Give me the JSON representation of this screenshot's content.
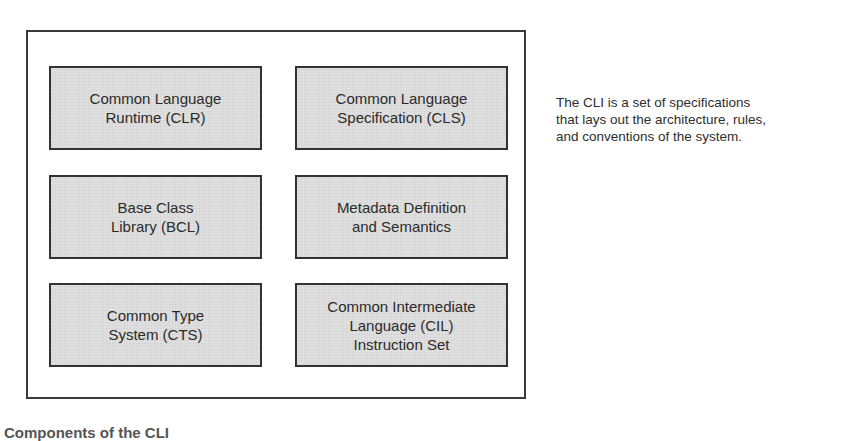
{
  "diagram": {
    "title": "Components of the CLI",
    "boxes": [
      {
        "label": "Common Language\nRuntime (CLR)"
      },
      {
        "label": "Common Language\nSpecification (CLS)"
      },
      {
        "label": "Base Class\nLibrary (BCL)"
      },
      {
        "label": "Metadata Definition\nand Semantics"
      },
      {
        "label": "Common Type\nSystem (CTS)"
      },
      {
        "label": "Common Intermediate\nLanguage (CIL)\nInstruction Set"
      }
    ],
    "annotation": "The CLI is a set of specifications\nthat lays out the architecture, rules,\nand conventions of the system.",
    "caption": "Components of the CLI"
  },
  "colors": {
    "box_fill": "#dcdcdc",
    "border": "#333333",
    "text": "#2b2b2b",
    "background": "#ffffff"
  }
}
